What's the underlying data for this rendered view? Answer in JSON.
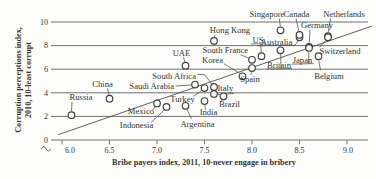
{
  "figure": {
    "background": "#fdfdfb",
    "ink": "#3f3f3f",
    "line_color": "#4d4d4d"
  },
  "chart_data": {
    "type": "scatter",
    "title": "",
    "xlabel": "Bribe payers index, 2011, 10-never engage in bribery",
    "ylabel_line1": "Corruption perceptions index,",
    "ylabel_line2": "2010, 10-least corrupt",
    "xlim": [
      6.0,
      9.0
    ],
    "ylim": [
      0,
      10
    ],
    "xticks": [
      6.0,
      6.5,
      7.0,
      7.5,
      8.0,
      8.5,
      9.0
    ],
    "yticks": [
      0,
      2,
      4,
      6,
      8,
      10
    ],
    "x_axis_break": true,
    "grid": "horizontal",
    "legend": "none",
    "trendline": {
      "x1": 5.96,
      "y1": 0.45,
      "x2": 9.26,
      "y2": 9.65
    },
    "points": [
      {
        "name": "Russia",
        "x": 6.1,
        "y": 2.1,
        "label": {
          "x": 81,
          "y": 100,
          "anchor": "middle",
          "lines": [
            "Russia"
          ]
        },
        "leaders": [
          [
            71.5,
            111.3,
            72,
            101.8
          ]
        ]
      },
      {
        "name": "China",
        "x": 6.5,
        "y": 3.5,
        "label": {
          "x": 102.5,
          "y": 86.5,
          "anchor": "middle",
          "lines": [
            "China"
          ]
        },
        "leaders": [
          [
            109,
            95,
            107.5,
            88.2
          ]
        ]
      },
      {
        "name": "Mexico",
        "x": 7.0,
        "y": 3.1,
        "label": {
          "x": 141,
          "y": 114,
          "anchor": "middle",
          "lines": [
            "Mexico"
          ]
        },
        "leaders": [
          [
            152.5,
            110.3,
            155.3,
            106.6
          ]
        ]
      },
      {
        "name": "Indonesia",
        "x": 7.1,
        "y": 2.8,
        "label": {
          "x": 136.5,
          "y": 127.5,
          "anchor": "middle",
          "lines": [
            "Indonesia"
          ]
        },
        "leaders": [
          [
            151,
            122.6,
            164,
            110.2
          ]
        ]
      },
      {
        "name": "UAE",
        "x": 7.3,
        "y": 6.3,
        "label": {
          "x": 181.5,
          "y": 55.5,
          "anchor": "middle",
          "lines": [
            "UAE"
          ]
        },
        "leaders": [
          [
            183.5,
            57.4,
            184.8,
            62
          ]
        ]
      },
      {
        "name": "Argentina",
        "x": 7.3,
        "y": 2.9,
        "label": {
          "x": 197.5,
          "y": 126.5,
          "anchor": "middle",
          "lines": [
            "Argentina"
          ]
        },
        "leaders": [
          [
            191.5,
            118.6,
            186.9,
            109.4
          ]
        ]
      },
      {
        "name": "Saudi Arabia",
        "x": 7.4,
        "y": 4.7,
        "label": {
          "x": 174,
          "y": 88.5,
          "anchor": "end",
          "lines": [
            "Saudi Arabia"
          ]
        },
        "leaders": [
          [
            175.5,
            86,
            191.2,
            85
          ]
        ]
      },
      {
        "name": "Turkey",
        "x": 7.5,
        "y": 4.4,
        "label": {
          "x": 182.5,
          "y": 101.5,
          "anchor": "middle",
          "lines": [
            "Turkey"
          ]
        },
        "leaders": [
          [
            193.5,
            96.4,
            201.2,
            90.9
          ]
        ]
      },
      {
        "name": "India",
        "x": 7.5,
        "y": 3.3,
        "label": {
          "x": 208.5,
          "y": 115,
          "anchor": "middle",
          "lines": [
            "India"
          ]
        },
        "leaders": [
          [
            205.5,
            109.8,
            204.7,
            104.8
          ]
        ]
      },
      {
        "name": "Hong Kong",
        "x": 7.6,
        "y": 8.4,
        "label": {
          "x": 230,
          "y": 33,
          "anchor": "middle",
          "lines": [
            "Hong Kong"
          ]
        },
        "leaders": [
          [
            215,
            34.7,
            214.3,
            37.1
          ]
        ]
      },
      {
        "name": "South Africa",
        "x": 7.6,
        "y": 4.5,
        "label": {
          "x": 196,
          "y": 79,
          "anchor": "end",
          "lines": [
            "South Africa"
          ]
        },
        "leaders": [
          [
            197.5,
            74.5,
            204.5,
            74.5
          ],
          [
            204.5,
            74.5,
            212,
            84.3
          ]
        ]
      },
      {
        "name": "Italy",
        "x": 7.6,
        "y": 3.9,
        "label": {
          "x": 217.5,
          "y": 91.3,
          "anchor": "start",
          "lines": [
            "Italy"
          ]
        },
        "leaders": [
          [
            216.8,
            94.6,
            234,
            93.4
          ]
        ]
      },
      {
        "name": "Brazil",
        "x": 7.7,
        "y": 3.7,
        "label": {
          "x": 219,
          "y": 106.5,
          "anchor": "start",
          "lines": [
            "Brazil"
          ]
        },
        "leaders": [
          [
            220.5,
            100.9,
            222.7,
            99.7
          ]
        ]
      },
      {
        "name": "South Korea",
        "x": 7.9,
        "y": 5.4,
        "label": {
          "x": 212.5,
          "y": 53,
          "anchor": "middle",
          "lines": [
            "South",
            "Korea"
          ]
        },
        "leaders": [
          [
            224,
            63.8,
            239.6,
            73.2
          ]
        ]
      },
      {
        "name": "France",
        "x": 8.0,
        "y": 6.8,
        "label": {
          "x": 236.5,
          "y": 53,
          "anchor": "middle",
          "lines": [
            "France"
          ]
        },
        "leaders": [
          [
            240.5,
            54.8,
            248.7,
            58.1
          ]
        ]
      },
      {
        "name": "Spain",
        "x": 8.0,
        "y": 6.1,
        "label": {
          "x": 250,
          "y": 82,
          "anchor": "middle",
          "lines": [
            "Spain"
          ]
        },
        "leaders": [
          [
            250.8,
            74.9,
            251.8,
            71.6
          ]
        ]
      },
      {
        "name": "US",
        "x": 8.1,
        "y": 7.1,
        "label": {
          "x": 258,
          "y": 42.5,
          "anchor": "middle",
          "lines": [
            "US"
          ]
        },
        "leaders": [
          [
            251,
            43.9,
            265,
            43.9
          ],
          [
            260.5,
            43.9,
            261.3,
            52.6
          ]
        ]
      },
      {
        "name": "Britain",
        "x": 8.3,
        "y": 7.6,
        "label": {
          "x": 279,
          "y": 67.5,
          "anchor": "middle",
          "lines": [
            "Britain"
          ]
        },
        "leaders": [
          [
            266.5,
            69,
            292,
            68.5
          ],
          [
            281,
            68.5,
            280.7,
            53.9
          ]
        ]
      },
      {
        "name": "Singapore",
        "x": 8.3,
        "y": 9.3,
        "label": {
          "x": 267,
          "y": 17,
          "anchor": "middle",
          "lines": [
            "Singapore"
          ]
        },
        "leaders": [
          [
            279.3,
            18.6,
            280.4,
            26.6
          ]
        ]
      },
      {
        "name": "Australia",
        "x": 8.5,
        "y": 8.7,
        "label": {
          "x": 276.5,
          "y": 44.5,
          "anchor": "middle",
          "lines": [
            "Australia"
          ]
        },
        "leaders": [
          [
            257.5,
            45.8,
            295,
            45.3
          ],
          [
            295,
            45.3,
            298.4,
            40.4
          ]
        ]
      },
      {
        "name": "Canada",
        "x": 8.5,
        "y": 8.9,
        "label": {
          "x": 296.5,
          "y": 17,
          "anchor": "middle",
          "lines": [
            "Canada"
          ]
        },
        "leaders": [
          [
            296,
            18.6,
            298.9,
            31.2
          ]
        ]
      },
      {
        "name": "Germany",
        "x": 8.6,
        "y": 7.9,
        "label": {
          "x": 317,
          "y": 28,
          "anchor": "middle",
          "lines": [
            "Germany"
          ]
        },
        "leaders": [
          [
            310,
            29.6,
            309.2,
            42.9
          ]
        ]
      },
      {
        "name": "Japan",
        "x": 8.6,
        "y": 7.8,
        "label": {
          "x": 302.5,
          "y": 62.5,
          "anchor": "middle",
          "lines": [
            "Japan"
          ]
        },
        "leaders": [
          [
            291.5,
            64.1,
            313.5,
            63.6
          ],
          [
            308.6,
            63.6,
            308.9,
            51.7
          ]
        ]
      },
      {
        "name": "Belgium",
        "x": 8.7,
        "y": 7.1,
        "label": {
          "x": 329,
          "y": 79,
          "anchor": "middle",
          "lines": [
            "Belgium"
          ]
        },
        "leaders": [
          [
            320.5,
            70.4,
            318.7,
            59.9
          ]
        ]
      },
      {
        "name": "Netherlands",
        "x": 8.8,
        "y": 8.8,
        "label": {
          "x": 344,
          "y": 17,
          "anchor": "middle",
          "lines": [
            "Netherlands"
          ]
        },
        "leaders": [
          [
            330.5,
            18.6,
            328.2,
            32.3
          ]
        ]
      },
      {
        "name": "Switzerland",
        "x": 8.8,
        "y": 8.7,
        "label": {
          "x": 340,
          "y": 53.5,
          "anchor": "middle",
          "lines": [
            "Switzerland"
          ]
        },
        "leaders": [
          [
            319.5,
            47.4,
            325.6,
            40.3
          ]
        ]
      }
    ]
  }
}
